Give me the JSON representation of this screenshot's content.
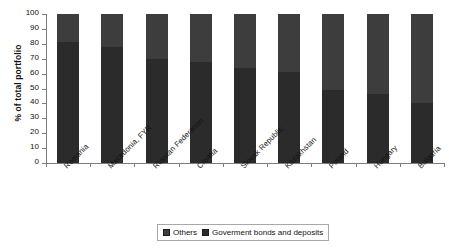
{
  "chart_data": {
    "type": "bar",
    "stacked": true,
    "title": "",
    "subtitle": "",
    "xlabel": "",
    "ylabel": "% of total portfolio",
    "ylim": [
      0,
      100
    ],
    "ytick_labels": [
      "0",
      "10",
      "20",
      "30",
      "40",
      "50",
      "60",
      "70",
      "80",
      "90",
      "100"
    ],
    "ytick_values": [
      0,
      10,
      20,
      30,
      40,
      50,
      60,
      70,
      80,
      90,
      100
    ],
    "grid": false,
    "legend_position": "bottom",
    "categories": [
      "Romania",
      "Macedonia, FYR",
      "Russian Federation",
      "Croatia",
      "Slovak Republic",
      "Kazakhstan",
      "Poland",
      "Hungary",
      "Bulgaria"
    ],
    "series": [
      {
        "name": "Goverment bonds and deposits",
        "color": "#2b2b2b",
        "values": [
          81,
          78,
          70,
          68,
          64,
          61,
          49,
          46,
          40
        ]
      },
      {
        "name": "Others",
        "color": "#3d3d3d",
        "values": [
          19,
          22,
          30,
          32,
          36,
          39,
          51,
          54,
          60
        ]
      }
    ]
  },
  "legend": {
    "entries": [
      {
        "label": "Others",
        "color": "#3d3d3d"
      },
      {
        "label": "Goverment bonds and deposits",
        "color": "#2b2b2b"
      }
    ]
  },
  "axes": {
    "axis_color": "#7d7d7d"
  }
}
